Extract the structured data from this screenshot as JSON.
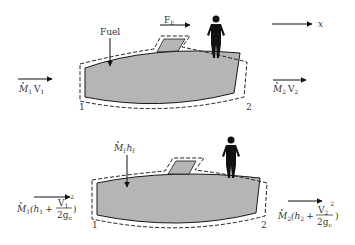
{
  "top_figure": {
    "fuel_label": "Fuel",
    "force_label": "F",
    "force_sub": "E",
    "axis_label": "x",
    "inlet": {
      "label": "M",
      "sub1": "1",
      "v": "V",
      "vsub": "1"
    },
    "outlet": {
      "label": "M",
      "sub1": "2",
      "v": "V",
      "vsub": "2"
    },
    "station_1": "1",
    "station_2": "2"
  },
  "bottom_figure": {
    "fuel_label": "M",
    "fuel_sub": "f",
    "fuel_h": "h",
    "fuel_hsub": "f",
    "inlet": {
      "m": "M",
      "msub": "1",
      "h": "(h",
      "hsub": "1",
      "plus": "+",
      "num": "V",
      "numsub": "1",
      "sup": "2",
      "den": "2g",
      "densub": "c",
      "close": ")"
    },
    "outlet": {
      "m": "M",
      "msub": "2",
      "h": "(h",
      "hsub": "2",
      "plus": "+",
      "num": "V",
      "numsub": "2",
      "sup": "2",
      "den": "2g",
      "densub": "c",
      "close": ")"
    },
    "station_1": "1",
    "station_2": "2"
  },
  "colors": {
    "body_fill": "#b5b5b5",
    "outline": "#1a1a1a",
    "person": "#111111"
  }
}
